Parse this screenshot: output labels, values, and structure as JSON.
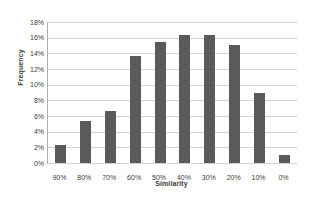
{
  "chart_data": {
    "type": "bar",
    "title": "",
    "xlabel": "Similarity",
    "ylabel": "Frequency",
    "categories": [
      "90%",
      "80%",
      "70%",
      "60%",
      "50%",
      "40%",
      "30%",
      "20%",
      "10%",
      "0%"
    ],
    "values": [
      2.3,
      5.4,
      6.6,
      13.6,
      15.4,
      16.4,
      16.3,
      15.1,
      8.9,
      1.0
    ],
    "ylim": [
      0,
      18
    ],
    "ytick_labels": [
      "18%",
      "16%",
      "14%",
      "12%",
      "10%",
      "8%",
      "6%",
      "4%",
      "2%",
      "0%"
    ],
    "ytick_values": [
      18,
      16,
      14,
      12,
      10,
      8,
      6,
      4,
      2,
      0
    ],
    "grid": true,
    "legend": false,
    "bar_color": "#5a5a5a",
    "gridline_color": "#d4d4d4",
    "axis_color": "#b0b0b0",
    "background_color": "#ffffff"
  }
}
